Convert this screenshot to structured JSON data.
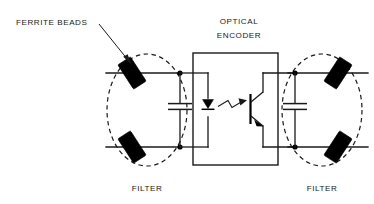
{
  "diagram": {
    "background_color": "#ffffff",
    "line_color": "#1a1a1a",
    "bead_color": "#000000",
    "labels": {
      "ferrite_beads": "FERRITE BEADS",
      "optical_encoder_line1": "OPTICAL",
      "optical_encoder_line2": "ENCODER",
      "filter_left": "FILTER",
      "filter_right": "FILTER"
    },
    "components": {
      "ferrite_bead_count": 4,
      "capacitor_count": 2,
      "led_count": 1,
      "phototransistor_count": 1,
      "filter_sections": 2,
      "junction_dots": 4
    }
  }
}
